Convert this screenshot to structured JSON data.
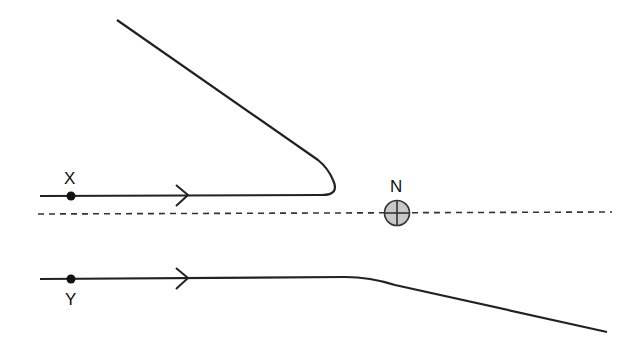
{
  "diagram": {
    "type": "particle-trajectories-near-nucleus",
    "labels": {
      "x": "X",
      "y": "Y",
      "n": "N"
    },
    "elements": {
      "nucleus": {
        "label": "N",
        "fill": "#c8c8c8",
        "stroke": "#333333"
      },
      "axis": {
        "style": "dashed"
      },
      "path_x": {
        "start_label": "X",
        "behavior": "deflected back (U-turn up-left)"
      },
      "path_y": {
        "start_label": "Y",
        "behavior": "deflected slightly downward"
      }
    },
    "colors": {
      "line": "#222222",
      "nucleus_fill": "#c8c8c8",
      "background": "#ffffff"
    }
  }
}
